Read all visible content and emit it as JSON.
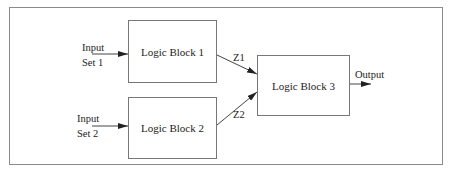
{
  "diagram": {
    "type": "block-diagram",
    "blocks": [
      {
        "id": "block1",
        "label": "Logic Block 1"
      },
      {
        "id": "block2",
        "label": "Logic Block 2"
      },
      {
        "id": "block3",
        "label": "Logic Block 3"
      }
    ],
    "inputs": [
      {
        "id": "input1",
        "line1": "Input",
        "line2": "Set 1",
        "target": "block1"
      },
      {
        "id": "input2",
        "line1": "Input",
        "line2": "Set 2",
        "target": "block2"
      }
    ],
    "signals": [
      {
        "id": "z1",
        "label": "Z1",
        "from": "block1",
        "to": "block3"
      },
      {
        "id": "z2",
        "label": "Z2",
        "from": "block2",
        "to": "block3"
      }
    ],
    "output": {
      "label": "Output",
      "from": "block3"
    },
    "colors": {
      "line": "#444444",
      "frame": "#8a8a8a",
      "block_border": "#777777",
      "text": "#222222"
    }
  }
}
